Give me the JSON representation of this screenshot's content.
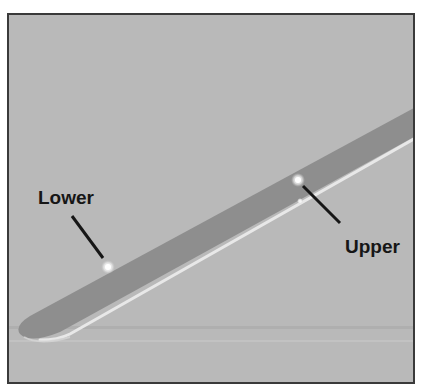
{
  "figure": {
    "background_color": "#b9b9b9",
    "strip_color": "#8c8c8c",
    "highlight_color": "#e6e6e6",
    "frame_color": "#3a3a3a"
  },
  "annotations": [
    {
      "id": "lower",
      "label": "Lower",
      "point": [
        108,
        267
      ]
    },
    {
      "id": "upper",
      "label": "Upper",
      "point": [
        298,
        180
      ]
    }
  ]
}
